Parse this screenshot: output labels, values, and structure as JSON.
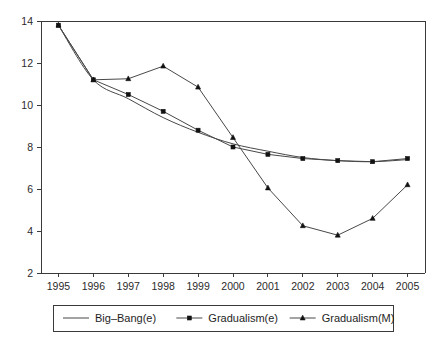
{
  "chart_data": {
    "type": "line",
    "title": "",
    "subtitle": "",
    "xlabel": "",
    "ylabel": "",
    "categories": [
      "1995",
      "1996",
      "1997",
      "1998",
      "1999",
      "2000",
      "2001",
      "2002",
      "2003",
      "2004",
      "2005"
    ],
    "x": [
      1995,
      1996,
      1997,
      1998,
      1999,
      2000,
      2001,
      2002,
      2003,
      2004,
      2005
    ],
    "xlim": [
      1994.5,
      2005.5
    ],
    "ylim": [
      2,
      14
    ],
    "yticks": [
      2,
      4,
      6,
      8,
      10,
      12,
      14
    ],
    "ytick_labels": [
      "2",
      "4",
      "6",
      "8",
      "10",
      "12",
      "14"
    ],
    "xticks": [
      1995,
      1996,
      1997,
      1998,
      1999,
      2000,
      2001,
      2002,
      2003,
      2004,
      2005
    ],
    "xtick_labels": [
      "1995",
      "1996",
      "1997",
      "1998",
      "1999",
      "2000",
      "2001",
      "2002",
      "2003",
      "2004",
      "2005"
    ],
    "grid": false,
    "legend_position": "below-plot",
    "series": [
      {
        "name": "Big-Bang(e)",
        "marker": "none",
        "line_style": "solid",
        "color": "#484848",
        "values": [
          13.8,
          11.2,
          10.3,
          9.4,
          8.7,
          8.15,
          7.8,
          7.5,
          7.35,
          7.3,
          7.4
        ]
      },
      {
        "name": "Gradualism(e)",
        "marker": "square",
        "line_style": "solid",
        "color": "#484848",
        "values": [
          13.8,
          11.2,
          10.5,
          9.7,
          8.8,
          8.0,
          7.65,
          7.45,
          7.35,
          7.3,
          7.45
        ]
      },
      {
        "name": "Gradualism(M)",
        "marker": "triangle",
        "line_style": "solid",
        "color": "#484848",
        "values": [
          13.8,
          11.2,
          11.25,
          11.85,
          10.85,
          8.45,
          6.05,
          4.25,
          3.8,
          4.6,
          6.2
        ]
      }
    ]
  },
  "legend": {
    "entries": [
      {
        "label": "Big–Bang(e)",
        "marker": "none"
      },
      {
        "label": "Gradualism(e)",
        "marker": "square"
      },
      {
        "label": "Gradualism(M)",
        "marker": "triangle"
      }
    ]
  }
}
